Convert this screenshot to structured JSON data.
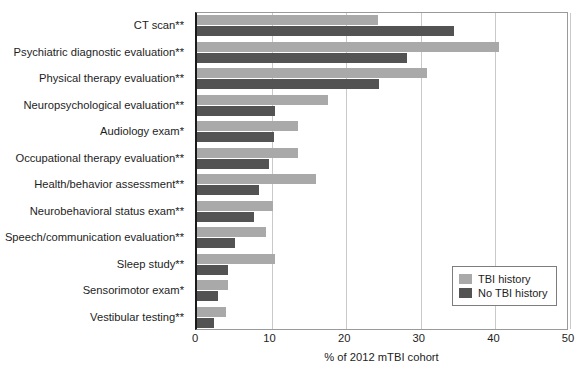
{
  "chart_data": {
    "type": "bar",
    "orientation": "horizontal",
    "title": "",
    "xlabel": "% of 2012 mTBI cohort",
    "ylabel": "",
    "xlim": [
      0,
      50
    ],
    "xticks": [
      0,
      10,
      20,
      30,
      40,
      50
    ],
    "xtick_labels": [
      "0",
      "10",
      "20",
      "30",
      "40",
      "50"
    ],
    "grid": "vertical",
    "legend_position": "bottom-right",
    "categories": [
      "CT scan**",
      "Psychiatric diagnostic evaluation**",
      "Physical therapy evaluation**",
      "Neuropsychological evaluation**",
      "Audiology exam*",
      "Occupational therapy evaluation**",
      "Health/behavior assessment**",
      "Neurobehavioral status exam**",
      "Speech/communication evaluation**",
      "Sleep study**",
      "Sensorimotor exam*",
      "Vestibular testing**"
    ],
    "series": [
      {
        "name": "TBI history",
        "color": "#a9a9a9",
        "values": [
          24.3,
          40.5,
          30.8,
          17.6,
          13.5,
          13.6,
          16.0,
          10.2,
          9.3,
          10.4,
          4.2,
          3.9
        ]
      },
      {
        "name": "No TBI history",
        "color": "#535353",
        "values": [
          34.4,
          28.1,
          24.4,
          10.5,
          10.3,
          9.7,
          8.3,
          7.7,
          5.1,
          4.2,
          2.8,
          2.3
        ]
      }
    ]
  }
}
